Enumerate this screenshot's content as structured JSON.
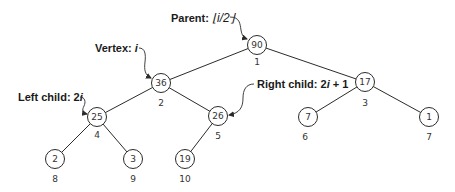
{
  "diagram": {
    "type": "binary-heap-array-indexing",
    "nodes": [
      {
        "index": "1",
        "value": "90",
        "x": 257,
        "y": 45
      },
      {
        "index": "2",
        "value": "36",
        "x": 161,
        "y": 83
      },
      {
        "index": "3",
        "value": "17",
        "x": 365,
        "y": 82
      },
      {
        "index": "4",
        "value": "25",
        "x": 97,
        "y": 117
      },
      {
        "index": "5",
        "value": "26",
        "x": 218,
        "y": 116
      },
      {
        "index": "6",
        "value": "7",
        "x": 308,
        "y": 117
      },
      {
        "index": "7",
        "value": "1",
        "x": 429,
        "y": 117
      },
      {
        "index": "8",
        "value": "2",
        "x": 55,
        "y": 159
      },
      {
        "index": "9",
        "value": "3",
        "x": 133,
        "y": 159
      },
      {
        "index": "10",
        "value": "19",
        "x": 185,
        "y": 159
      }
    ],
    "edges": [
      [
        "1",
        "2"
      ],
      [
        "1",
        "3"
      ],
      [
        "2",
        "4"
      ],
      [
        "2",
        "5"
      ],
      [
        "3",
        "6"
      ],
      [
        "3",
        "7"
      ],
      [
        "4",
        "8"
      ],
      [
        "4",
        "9"
      ],
      [
        "5",
        "10"
      ]
    ],
    "callouts": {
      "parent": {
        "prefix": "Parent: ",
        "formula": "⌊i/2⌋"
      },
      "vertex": {
        "prefix": "Vertex: ",
        "formula": "i"
      },
      "left_child": {
        "prefix": "Left child: 2",
        "formula": "i"
      },
      "right_child": {
        "prefix": "Right child: 2",
        "formula": "i",
        "suffix": " + 1"
      }
    }
  }
}
